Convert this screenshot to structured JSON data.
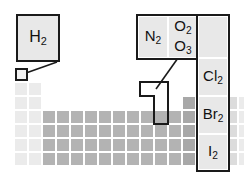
{
  "diagram": {
    "colors": {
      "outline": "#1a1a1a",
      "callout_fill": "#e8e8e8",
      "cell_light": "#ebebeb",
      "cell_mid": "#dcdcdc",
      "cell_dark": "#b3b3b3",
      "cell_darker": "#a8a8a8",
      "background": "#ffffff"
    }
  },
  "hydrogen_callout": {
    "name": "hydrogen-callout",
    "formula": "H",
    "subscript": "2",
    "label": "H2"
  },
  "nonmetal_callout": {
    "name": "nonmetal-callout",
    "cells": [
      {
        "id": "nitrogen",
        "formula": "N",
        "subscript": "2",
        "label": "N2"
      },
      {
        "id": "oxygen",
        "formula": "O",
        "subscript": "2",
        "label": "O2",
        "second_formula": "O",
        "second_subscript": "3",
        "second_label": "O3"
      },
      {
        "id": "fluorine",
        "formula": "F",
        "subscript": "2",
        "label": "F2"
      },
      {
        "id": "chlorine",
        "formula": "Cl",
        "subscript": "2",
        "label": "Cl2"
      },
      {
        "id": "bromine",
        "formula": "Br",
        "subscript": "2",
        "label": "Br2"
      },
      {
        "id": "iodine",
        "formula": "I",
        "subscript": "2",
        "label": "I2"
      }
    ]
  },
  "highlights": {
    "hydrogen_square": "hydrogen-cell-highlight",
    "lshape": "halogen-chalcogen-highlight"
  },
  "periodic_table": {
    "name": "periodic-table-grid",
    "cell_width": 14,
    "cell_height": 14,
    "origin_x": 14,
    "origin_y": 68,
    "cells": [
      {
        "col": 0,
        "row": 0,
        "tone": "light"
      },
      {
        "col": 0,
        "row": 1,
        "tone": "light"
      },
      {
        "col": 0,
        "row": 2,
        "tone": "light"
      },
      {
        "col": 0,
        "row": 3,
        "tone": "light"
      },
      {
        "col": 0,
        "row": 4,
        "tone": "light"
      },
      {
        "col": 0,
        "row": 5,
        "tone": "light"
      },
      {
        "col": 0,
        "row": 6,
        "tone": "light"
      },
      {
        "col": 1,
        "row": 1,
        "tone": "light"
      },
      {
        "col": 1,
        "row": 2,
        "tone": "light"
      },
      {
        "col": 1,
        "row": 3,
        "tone": "light"
      },
      {
        "col": 1,
        "row": 4,
        "tone": "light"
      },
      {
        "col": 1,
        "row": 5,
        "tone": "light"
      },
      {
        "col": 1,
        "row": 6,
        "tone": "light"
      },
      {
        "col": 2,
        "row": 3,
        "tone": "dark"
      },
      {
        "col": 3,
        "row": 3,
        "tone": "dark"
      },
      {
        "col": 4,
        "row": 3,
        "tone": "dark"
      },
      {
        "col": 5,
        "row": 3,
        "tone": "dark"
      },
      {
        "col": 6,
        "row": 3,
        "tone": "dark"
      },
      {
        "col": 7,
        "row": 3,
        "tone": "dark"
      },
      {
        "col": 8,
        "row": 3,
        "tone": "dark"
      },
      {
        "col": 9,
        "row": 3,
        "tone": "dark"
      },
      {
        "col": 10,
        "row": 3,
        "tone": "dark"
      },
      {
        "col": 11,
        "row": 3,
        "tone": "dark"
      },
      {
        "col": 2,
        "row": 4,
        "tone": "dark"
      },
      {
        "col": 3,
        "row": 4,
        "tone": "dark"
      },
      {
        "col": 4,
        "row": 4,
        "tone": "dark"
      },
      {
        "col": 5,
        "row": 4,
        "tone": "dark"
      },
      {
        "col": 6,
        "row": 4,
        "tone": "dark"
      },
      {
        "col": 7,
        "row": 4,
        "tone": "dark"
      },
      {
        "col": 8,
        "row": 4,
        "tone": "dark"
      },
      {
        "col": 9,
        "row": 4,
        "tone": "dark"
      },
      {
        "col": 10,
        "row": 4,
        "tone": "dark"
      },
      {
        "col": 11,
        "row": 4,
        "tone": "dark"
      },
      {
        "col": 2,
        "row": 5,
        "tone": "dark"
      },
      {
        "col": 3,
        "row": 5,
        "tone": "dark"
      },
      {
        "col": 4,
        "row": 5,
        "tone": "dark"
      },
      {
        "col": 5,
        "row": 5,
        "tone": "dark"
      },
      {
        "col": 6,
        "row": 5,
        "tone": "dark"
      },
      {
        "col": 7,
        "row": 5,
        "tone": "dark"
      },
      {
        "col": 8,
        "row": 5,
        "tone": "dark"
      },
      {
        "col": 9,
        "row": 5,
        "tone": "dark"
      },
      {
        "col": 10,
        "row": 5,
        "tone": "dark"
      },
      {
        "col": 11,
        "row": 5,
        "tone": "dark"
      },
      {
        "col": 2,
        "row": 6,
        "tone": "dark"
      },
      {
        "col": 3,
        "row": 6,
        "tone": "dark"
      },
      {
        "col": 4,
        "row": 6,
        "tone": "dark"
      },
      {
        "col": 5,
        "row": 6,
        "tone": "dark"
      },
      {
        "col": 6,
        "row": 6,
        "tone": "dark"
      },
      {
        "col": 7,
        "row": 6,
        "tone": "dark"
      },
      {
        "col": 8,
        "row": 6,
        "tone": "dark"
      },
      {
        "col": 9,
        "row": 6,
        "tone": "dark"
      },
      {
        "col": 10,
        "row": 6,
        "tone": "dark"
      },
      {
        "col": 11,
        "row": 6,
        "tone": "dark"
      },
      {
        "col": 12,
        "row": 2,
        "tone": "darker"
      },
      {
        "col": 12,
        "row": 3,
        "tone": "darker"
      },
      {
        "col": 12,
        "row": 4,
        "tone": "darker"
      },
      {
        "col": 12,
        "row": 5,
        "tone": "darker"
      },
      {
        "col": 12,
        "row": 6,
        "tone": "darker"
      },
      {
        "col": 13,
        "row": 2,
        "tone": "mid"
      },
      {
        "col": 13,
        "row": 3,
        "tone": "mid"
      },
      {
        "col": 13,
        "row": 4,
        "tone": "darker"
      },
      {
        "col": 13,
        "row": 5,
        "tone": "darker"
      },
      {
        "col": 13,
        "row": 6,
        "tone": "darker"
      },
      {
        "col": 14,
        "row": 2,
        "tone": "mid"
      },
      {
        "col": 14,
        "row": 3,
        "tone": "mid"
      },
      {
        "col": 14,
        "row": 4,
        "tone": "mid"
      },
      {
        "col": 14,
        "row": 5,
        "tone": "darker"
      },
      {
        "col": 14,
        "row": 6,
        "tone": "darker"
      },
      {
        "col": 15,
        "row": 2,
        "tone": "mid"
      },
      {
        "col": 15,
        "row": 3,
        "tone": "mid"
      },
      {
        "col": 15,
        "row": 4,
        "tone": "mid"
      },
      {
        "col": 15,
        "row": 5,
        "tone": "mid"
      },
      {
        "col": 15,
        "row": 6,
        "tone": "mid"
      },
      {
        "col": 16,
        "row": 2,
        "tone": "light"
      },
      {
        "col": 16,
        "row": 3,
        "tone": "light"
      },
      {
        "col": 16,
        "row": 4,
        "tone": "light"
      },
      {
        "col": 16,
        "row": 5,
        "tone": "light"
      },
      {
        "col": 16,
        "row": 6,
        "tone": "light"
      }
    ]
  }
}
